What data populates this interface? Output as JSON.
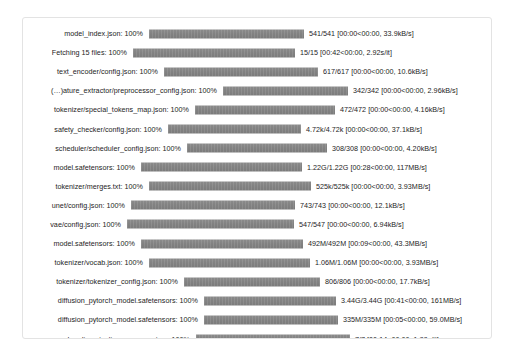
{
  "theme": {
    "page_background": "#ffffff",
    "card_background": "#ffffff",
    "card_border": "#e3e3e3",
    "bar_color": "#828282",
    "text_color": "#1d1d1d"
  },
  "progress_rows": [
    {
      "label": "model_index.json: 100%",
      "percent": 100,
      "stats": "541/541 [00:00<00:00, 33.9kB/s]",
      "label_right": 122,
      "bar_left": 126,
      "bar_right": 281,
      "stats_left": 286
    },
    {
      "label": "Fetching 15 files: 100%",
      "percent": 100,
      "stats": "15/15 [00:42<00:00,  2.92s/it]",
      "label_right": 106,
      "bar_left": 110,
      "bar_right": 272,
      "stats_left": 277
    },
    {
      "label": "text_encoder/config.json: 100%",
      "percent": 100,
      "stats": "617/617 [00:00<00:00, 10.6kB/s]",
      "label_right": 137,
      "bar_left": 141,
      "bar_right": 295,
      "stats_left": 300
    },
    {
      "label": "(…)ature_extractor/preprocessor_config.json: 100%",
      "percent": 100,
      "stats": "342/342 [00:00<00:00, 2.96kB/s]",
      "label_right": 196,
      "bar_left": 200,
      "bar_right": 325,
      "stats_left": 330
    },
    {
      "label": "tokenizer/special_tokens_map.json: 100%",
      "percent": 100,
      "stats": "472/472 [00:00<00:00, 4.16kB/s]",
      "label_right": 168,
      "bar_left": 172,
      "bar_right": 312,
      "stats_left": 317
    },
    {
      "label": "safety_checker/config.json: 100%",
      "percent": 100,
      "stats": "4.72k/4.72k [00:00<00:00, 37.1kB/s]",
      "label_right": 141,
      "bar_left": 145,
      "bar_right": 278,
      "stats_left": 283
    },
    {
      "label": "scheduler/scheduler_config.json: 100%",
      "percent": 100,
      "stats": "308/308 [00:00<00:00, 4.20kB/s]",
      "label_right": 160,
      "bar_left": 164,
      "bar_right": 304,
      "stats_left": 309
    },
    {
      "label": "model.safetensors: 100%",
      "percent": 100,
      "stats": "1.22G/1.22G [00:28<00:00, 117MB/s]",
      "label_right": 114,
      "bar_left": 118,
      "bar_right": 279,
      "stats_left": 284
    },
    {
      "label": "tokenizer/merges.txt: 100%",
      "percent": 100,
      "stats": "525k/525k [00:00<00:00, 3.93MB/s]",
      "label_right": 122,
      "bar_left": 126,
      "bar_right": 288,
      "stats_left": 293
    },
    {
      "label": "unet/config.json: 100%",
      "percent": 100,
      "stats": "743/743 [00:00<00:00, 12.1kB/s]",
      "label_right": 104,
      "bar_left": 108,
      "bar_right": 272,
      "stats_left": 277
    },
    {
      "label": "vae/config.json: 100%",
      "percent": 100,
      "stats": "547/547 [00:00<00:00, 6.94kB/s]",
      "label_right": 100,
      "bar_left": 104,
      "bar_right": 271,
      "stats_left": 276
    },
    {
      "label": "model.safetensors: 100%",
      "percent": 100,
      "stats": "492M/492M [00:09<00:00, 43.3MB/s]",
      "label_right": 114,
      "bar_left": 118,
      "bar_right": 280,
      "stats_left": 285
    },
    {
      "label": "tokenizer/vocab.json: 100%",
      "percent": 100,
      "stats": "1.06M/1.06M [00:00<00:00, 3.93MB/s]",
      "label_right": 122,
      "bar_left": 126,
      "bar_right": 287,
      "stats_left": 292
    },
    {
      "label": "tokenizer/tokenizer_config.json: 100%",
      "percent": 100,
      "stats": "806/806 [00:00<00:00, 17.7kB/s]",
      "label_right": 157,
      "bar_left": 161,
      "bar_right": 297,
      "stats_left": 302
    },
    {
      "label": "diffusion_pytorch_model.safetensors: 100%",
      "percent": 100,
      "stats": "3.44G/3.44G [00:41<00:00, 161MB/s]",
      "label_right": 177,
      "bar_left": 181,
      "bar_right": 313,
      "stats_left": 318
    },
    {
      "label": "diffusion_pytorch_model.safetensors: 100%",
      "percent": 100,
      "stats": "335M/335M [00:05<00:00, 59.0MB/s]",
      "label_right": 177,
      "bar_left": 181,
      "bar_right": 315,
      "stats_left": 320
    },
    {
      "label": "Loading pipeline components...: 100%",
      "percent": 100,
      "stats": "7/7 [00:14<00:00,  1.88s/it]",
      "label_right": 169,
      "bar_left": 173,
      "bar_right": 327,
      "stats_left": 332
    }
  ]
}
